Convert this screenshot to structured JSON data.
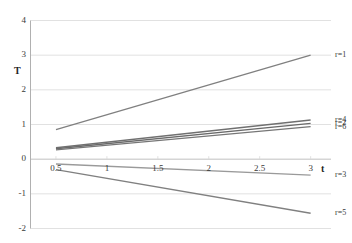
{
  "chart_data": {
    "type": "line",
    "title": "",
    "xlabel": "t",
    "ylabel": "T",
    "xlim": [
      0.25,
      3.2
    ],
    "ylim": [
      -2,
      4
    ],
    "grid": true,
    "legend_position": "right-inline-endpoint",
    "x_ticks": [
      "0.5",
      "1",
      "1.5",
      "2",
      "2.5",
      "3"
    ],
    "x_tick_values": [
      0.5,
      1,
      1.5,
      2,
      2.5,
      3
    ],
    "y_ticks": [
      "4",
      "3",
      "2",
      "1",
      "0",
      "-1",
      "-2"
    ],
    "y_tick_values": [
      4,
      3,
      2,
      1,
      0,
      -1,
      -2
    ],
    "series": [
      {
        "name": "r=1",
        "label": "r=1",
        "color": "#808080",
        "x": [
          0.5,
          3.0
        ],
        "values": [
          0.85,
          3.0
        ]
      },
      {
        "name": "r=4",
        "label": "r=4",
        "color": "#707070",
        "x": [
          0.5,
          3.0
        ],
        "values": [
          0.33,
          1.13
        ]
      },
      {
        "name": "r=2",
        "label": "r=2",
        "color": "#6a6a6a",
        "x": [
          0.5,
          3.0
        ],
        "values": [
          0.3,
          1.03
        ]
      },
      {
        "name": "r=6",
        "label": "r=6",
        "color": "#767676",
        "x": [
          0.5,
          3.0
        ],
        "values": [
          0.27,
          0.94
        ]
      },
      {
        "name": "r=3",
        "label": "r=3",
        "color": "#9a9a9a",
        "x": [
          0.5,
          3.0
        ],
        "values": [
          -0.14,
          -0.46
        ]
      },
      {
        "name": "r=5",
        "label": "r=5",
        "color": "#808080",
        "x": [
          0.5,
          3.0
        ],
        "values": [
          -0.3,
          -1.56
        ]
      }
    ],
    "axis_color": "#b0b0b0",
    "grid_color": "#d9d9d9",
    "zero_line_color": "#c0c0c0",
    "background": "#ffffff"
  }
}
